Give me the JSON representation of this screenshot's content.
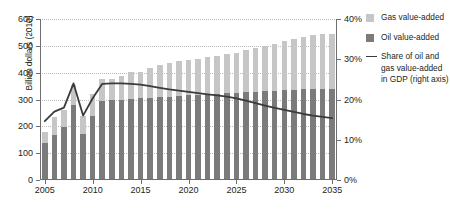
{
  "chart_data": {
    "type": "bar",
    "title": "",
    "xlabel": "",
    "ylabel": "Billion dollars (2010)",
    "y2label": "",
    "ylim": [
      0,
      600
    ],
    "y2lim": [
      0,
      40
    ],
    "yticks": [
      "0",
      "100",
      "200",
      "300",
      "400",
      "500",
      "600"
    ],
    "y2ticks": [
      "0%",
      "10%",
      "20%",
      "30%",
      "40%"
    ],
    "xticks": [
      "2005",
      "2010",
      "2015",
      "2020",
      "2025",
      "2030",
      "2035"
    ],
    "grid": true,
    "legend_position": "right",
    "categories": [
      "2005",
      "2006",
      "2007",
      "2008",
      "2009",
      "2010",
      "2011",
      "2012",
      "2013",
      "2014",
      "2015",
      "2016",
      "2017",
      "2018",
      "2019",
      "2020",
      "2021",
      "2022",
      "2023",
      "2024",
      "2025",
      "2026",
      "2027",
      "2028",
      "2029",
      "2030",
      "2031",
      "2032",
      "2033",
      "2034",
      "2035"
    ],
    "series": [
      {
        "name": "Oil value-added",
        "color": "#7b7b7b",
        "axis": "left",
        "values": [
          137,
          168,
          197,
          278,
          172,
          238,
          293,
          299,
          300,
          303,
          305,
          307,
          309,
          311,
          313,
          315,
          317,
          319,
          321,
          323,
          325,
          327,
          329,
          331,
          333,
          335,
          337,
          338,
          339,
          340,
          341
        ]
      },
      {
        "name": "Gas value-added",
        "color": "#c6c6c6",
        "axis": "left",
        "values": [
          41,
          65,
          65,
          75,
          68,
          81,
          82,
          77,
          87,
          100,
          98,
          112,
          121,
          126,
          130,
          133,
          134,
          138,
          142,
          146,
          150,
          156,
          162,
          168,
          175,
          182,
          188,
          195,
          200,
          203,
          204
        ]
      },
      {
        "name": "Share of oil and gas value-added in GDP (right axis)",
        "color": "#3b3b3b",
        "axis": "right",
        "type": "line",
        "values": [
          14.6,
          17.0,
          18.0,
          24.0,
          16.0,
          20.3,
          23.9,
          24.0,
          24.0,
          23.9,
          23.7,
          23.3,
          22.9,
          22.5,
          22.2,
          21.9,
          21.6,
          21.3,
          21.0,
          20.7,
          20.3,
          19.7,
          19.1,
          18.5,
          17.9,
          17.4,
          16.9,
          16.4,
          16.0,
          15.7,
          15.4
        ]
      }
    ]
  },
  "legend": {
    "items": [
      {
        "label": "Gas value-added",
        "swatch": "gas-swatch"
      },
      {
        "label": "Oil value-added",
        "swatch": "oil-swatch"
      }
    ],
    "line_label_1": "Share of oil and",
    "line_label_2": "gas value-added",
    "line_label_3": "in GDP (right axis)"
  },
  "colors": {
    "gas": "#c6c6c6",
    "oil": "#7b7b7b",
    "line": "#3b3b3b",
    "axis": "#6d6e71",
    "grid": "#b9b9b9",
    "text": "#231f20"
  }
}
